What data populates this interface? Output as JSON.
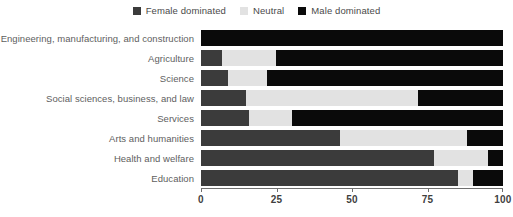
{
  "chart_data": {
    "type": "bar",
    "orientation": "horizontal",
    "stacked": true,
    "normalized": true,
    "title": "",
    "subtitle": "",
    "xlabel": "",
    "ylabel": "",
    "xlim": [
      0,
      100
    ],
    "xticks": [
      0,
      25,
      50,
      75,
      100
    ],
    "xtick_labels": [
      "0",
      "25",
      "50",
      "75",
      "100"
    ],
    "grid": false,
    "legend_position": "top-center",
    "categories": [
      "Engineering, manufacturing, and construction",
      "Agriculture",
      "Science",
      "Social sciences, business, and law",
      "Services",
      "Arts and humanities",
      "Health and welfare",
      "Education"
    ],
    "series": [
      {
        "name": "Female dominated",
        "color": "#3b3b3b",
        "values": [
          0,
          7,
          9,
          15,
          16,
          46,
          77,
          85
        ]
      },
      {
        "name": "Neutral",
        "color": "#e2e2e2",
        "values": [
          0,
          18,
          13,
          57,
          14,
          42,
          18,
          5
        ]
      },
      {
        "name": "Male dominated",
        "color": "#0a0a0a",
        "values": [
          100,
          75,
          78,
          28,
          70,
          12,
          5,
          10
        ]
      }
    ]
  },
  "legend": {
    "items": [
      {
        "label": "Female dominated",
        "color": "#3b3b3b",
        "swatch_name": "legend-swatch-female-dominated"
      },
      {
        "label": "Neutral",
        "color": "#e2e2e2",
        "swatch_name": "legend-swatch-neutral"
      },
      {
        "label": "Male dominated",
        "color": "#0a0a0a",
        "swatch_name": "legend-swatch-male-dominated"
      }
    ]
  },
  "axis": {
    "tick_labels": [
      "0",
      "25",
      "50",
      "75",
      "100"
    ]
  },
  "colors": {
    "female_dominated": "#3b3b3b",
    "neutral": "#e2e2e2",
    "male_dominated": "#0a0a0a",
    "axis": "#6f6f6f",
    "label_text": "#5e5e5e",
    "tick_text": "#3f3f3f",
    "background": "#ffffff"
  }
}
